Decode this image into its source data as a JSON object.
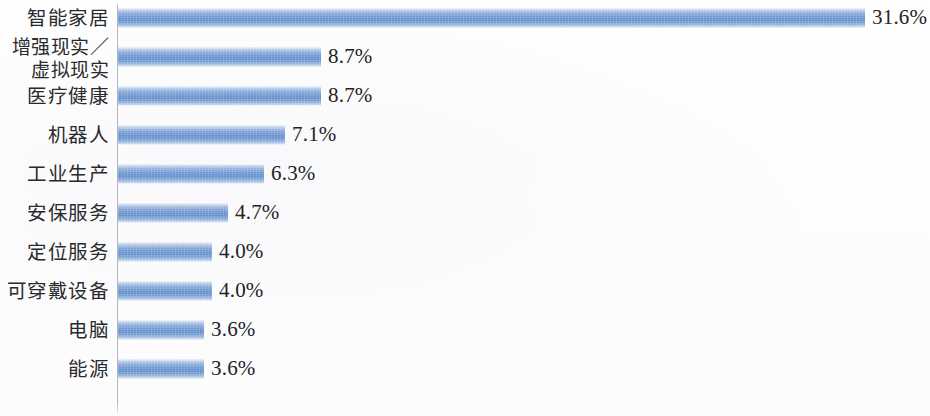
{
  "chart_data": {
    "type": "bar",
    "orientation": "horizontal",
    "title": "",
    "subtitle": "",
    "xlabel": "",
    "ylabel": "",
    "grid": false,
    "legend": null,
    "axis_line": "vertical category axis at left of bars",
    "value_suffix": "%",
    "xlim": [
      0,
      31.6
    ],
    "categories": [
      "智能家居",
      "增强现实／\n虚拟现实",
      "医疗健康",
      "机器人",
      "工业生产",
      "安保服务",
      "定位服务",
      "可穿戴设备",
      "电脑",
      "能源"
    ],
    "values": [
      31.6,
      8.7,
      8.7,
      7.1,
      6.3,
      4.7,
      4.0,
      4.0,
      3.6,
      3.6
    ],
    "data_labels": [
      "31.6%",
      "8.7%",
      "8.7%",
      "7.1%",
      "6.3%",
      "4.7%",
      "4.0%",
      "4.0%",
      "3.6%",
      "3.6%"
    ],
    "bar_color": "#6f99d2",
    "bar_color_light": "#b9ccea",
    "bar_color_dark": "#6792ce",
    "axis_color": "#969aa2",
    "text_color": "#232325",
    "background": "#ffffff"
  },
  "rows": [
    {
      "label": "智能家居",
      "value": "31.6%",
      "bar_px": 747,
      "multiline": false
    },
    {
      "label": "增强现实／\n虚拟现实",
      "value": "8.7%",
      "bar_px": 203,
      "multiline": true
    },
    {
      "label": "医疗健康",
      "value": "8.7%",
      "bar_px": 203,
      "multiline": false
    },
    {
      "label": "机器人",
      "value": "7.1%",
      "bar_px": 167,
      "multiline": false
    },
    {
      "label": "工业生产",
      "value": "6.3%",
      "bar_px": 146,
      "multiline": false
    },
    {
      "label": "安保服务",
      "value": "4.7%",
      "bar_px": 110,
      "multiline": false
    },
    {
      "label": "定位服务",
      "value": "4.0%",
      "bar_px": 94,
      "multiline": false
    },
    {
      "label": "可穿戴设备",
      "value": "4.0%",
      "bar_px": 94,
      "multiline": false
    },
    {
      "label": "电脑",
      "value": "3.6%",
      "bar_px": 86,
      "multiline": false
    },
    {
      "label": "能源",
      "value": "3.6%",
      "bar_px": 86,
      "multiline": false
    }
  ]
}
